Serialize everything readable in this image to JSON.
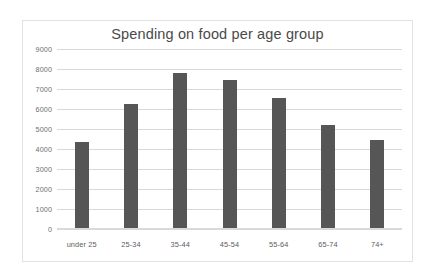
{
  "chart_data": {
    "type": "bar",
    "title": "Spending on food per age group",
    "xlabel": "",
    "ylabel": "",
    "categories": [
      "under 25",
      "25-34",
      "35-44",
      "45-54",
      "55-64",
      "65-74",
      "74+"
    ],
    "values": [
      4350,
      6250,
      7800,
      7450,
      6550,
      5200,
      4450
    ],
    "series": [
      {
        "name": "Spending",
        "values": [
          4350,
          6250,
          7800,
          7450,
          6550,
          5200,
          4450
        ]
      }
    ],
    "ylim": [
      0,
      9000
    ],
    "yticks": [
      0,
      1000,
      2000,
      3000,
      4000,
      5000,
      6000,
      7000,
      8000,
      9000
    ],
    "ytick_labels": [
      "0",
      "1000",
      "2000",
      "3000",
      "4000",
      "5000",
      "6000",
      "7000",
      "8000",
      "9000"
    ],
    "grid": true,
    "grid_axis": "y",
    "legend": false,
    "legend_position": "none",
    "bar_color": "#565656",
    "gridline_color": "#d9d9d9",
    "title_color": "#4a4a4a",
    "tick_label_color": "#6e6e6e",
    "frame_border_color": "#e2e2e2",
    "background_color": "#ffffff"
  }
}
